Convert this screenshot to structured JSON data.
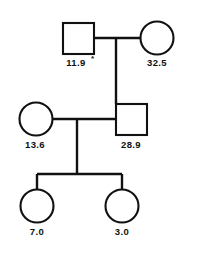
{
  "diagram": {
    "type": "pedigree",
    "stroke_color": "#111111",
    "background_color": "#ffffff",
    "generations": 3,
    "individuals": [
      {
        "id": "I-1",
        "generation": 1,
        "sex": "male",
        "shape": "square",
        "label": "11.9",
        "annotation": "*",
        "cx": 78,
        "cy": 38
      },
      {
        "id": "I-2",
        "generation": 1,
        "sex": "female",
        "shape": "circle",
        "label": "32.5",
        "annotation": "",
        "cx": 157,
        "cy": 38
      },
      {
        "id": "II-1",
        "generation": 2,
        "sex": "female",
        "shape": "circle",
        "label": "13.6",
        "annotation": "",
        "cx": 36,
        "cy": 119
      },
      {
        "id": "II-2",
        "generation": 2,
        "sex": "male",
        "shape": "square",
        "label": "28.9",
        "annotation": "",
        "cx": 131,
        "cy": 119
      },
      {
        "id": "III-1",
        "generation": 3,
        "sex": "female",
        "shape": "circle",
        "label": "7.0",
        "annotation": "",
        "cx": 37,
        "cy": 206
      },
      {
        "id": "III-2",
        "generation": 3,
        "sex": "female",
        "shape": "circle",
        "label": "3.0",
        "annotation": "",
        "cx": 122,
        "cy": 206
      }
    ],
    "labels": {
      "founder_male": "11.9",
      "founder_male_mark": "*",
      "founder_female": "32.5",
      "gen2_female": "13.6",
      "gen2_male": "28.9",
      "child_left": "7.0",
      "child_right": "3.0"
    }
  }
}
